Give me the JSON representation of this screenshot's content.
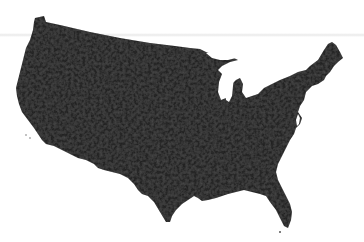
{
  "map": {
    "subject": "Contiguous United States",
    "style": "county-level choropleth silhouette",
    "fill_color": "#262626",
    "texture_color_light": "#3a3a3a",
    "texture_color_dark": "#1a1a1a",
    "background_color": "#ffffff",
    "water_color": "#ffffff",
    "legend": null,
    "title": null
  }
}
